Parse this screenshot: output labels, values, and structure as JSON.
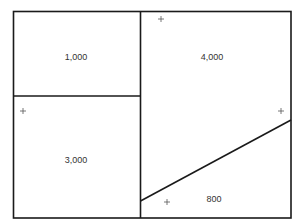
{
  "diagram": {
    "type": "area-partition",
    "stroke_color": "#1a1a1a",
    "text_color": "#333333",
    "regions": [
      {
        "id": "top-left",
        "label": "1,000",
        "x": 76,
        "y": 57
      },
      {
        "id": "bottom-left",
        "label": "3,000",
        "x": 76,
        "y": 160
      },
      {
        "id": "top-right",
        "label": "4,000",
        "x": 212,
        "y": 57
      },
      {
        "id": "bottom-right-triangle",
        "label": "800",
        "x": 214,
        "y": 199
      }
    ],
    "markers": [
      {
        "symbol": "+",
        "x": 161,
        "y": 19
      },
      {
        "symbol": "+",
        "x": 23,
        "y": 111
      },
      {
        "symbol": "+",
        "x": 281,
        "y": 111
      },
      {
        "symbol": "+",
        "x": 167,
        "y": 202
      }
    ]
  }
}
